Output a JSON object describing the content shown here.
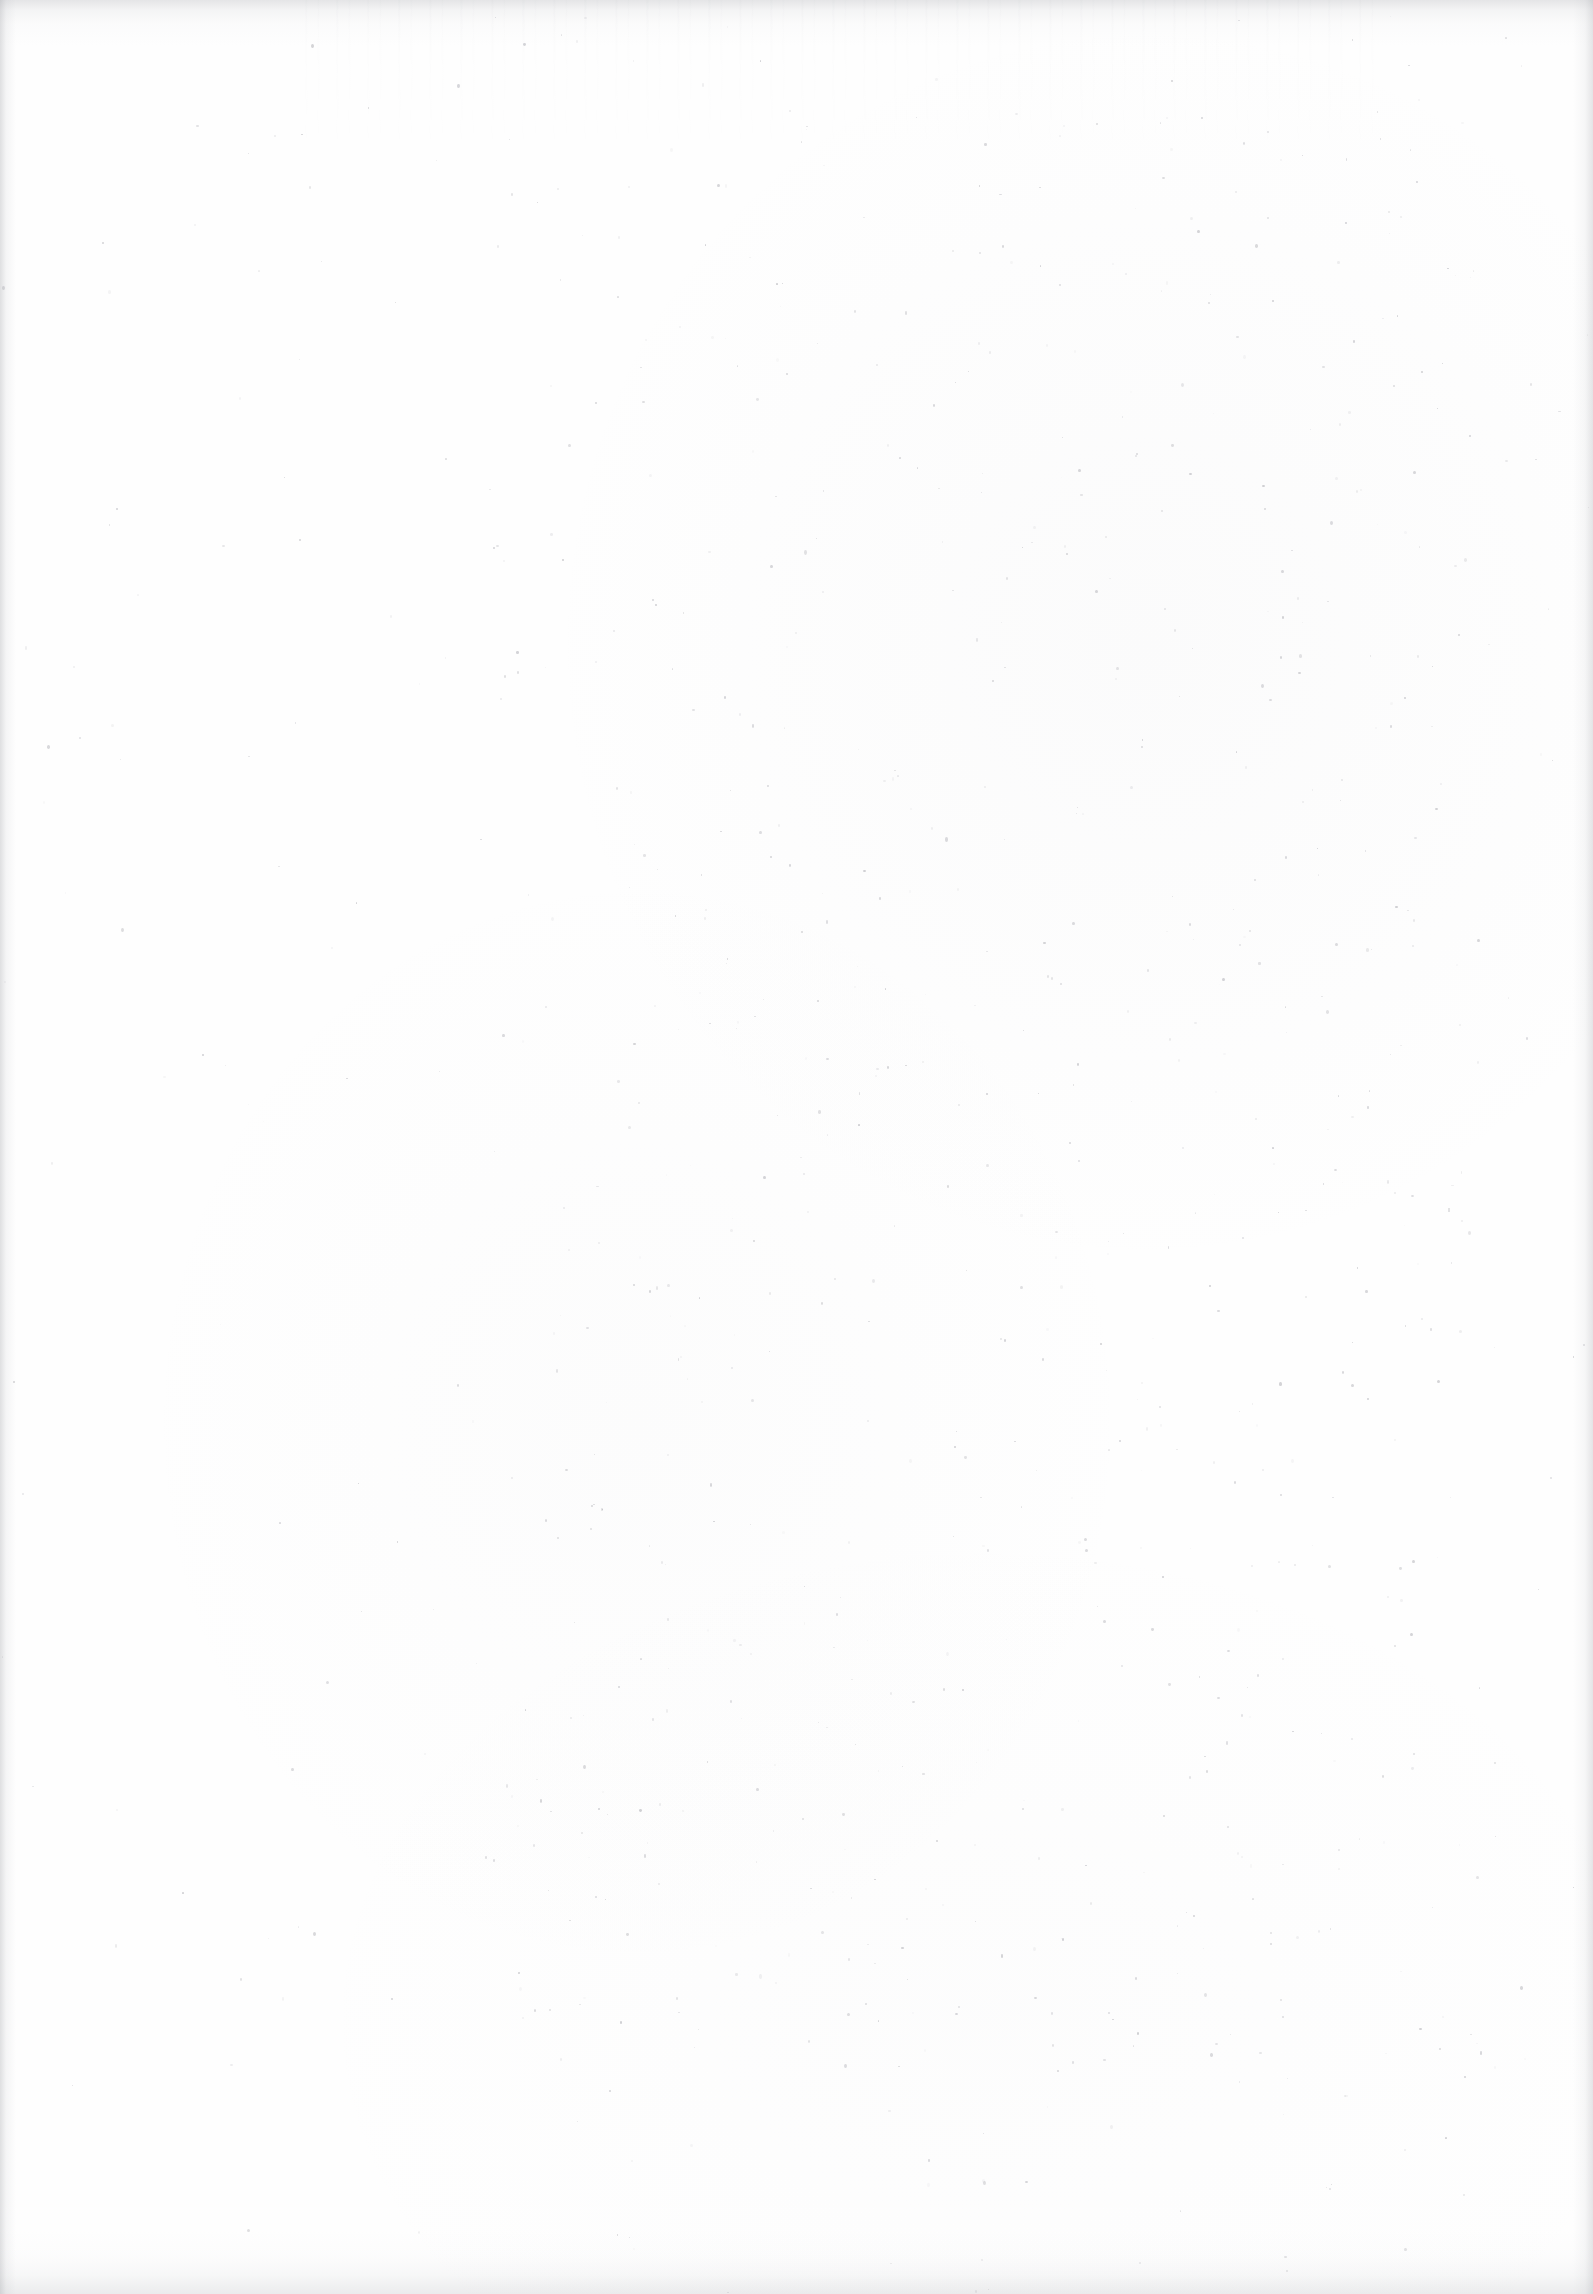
{
  "document": {
    "kind": "scanned-page",
    "page_state": "blank",
    "visible_text": "",
    "content_note": "No printed text, figures, rules, page number, headers or footers are present on this leaf."
  },
  "canvas": {
    "width": 1593,
    "height": 2294
  },
  "paper": {
    "base_color": "#fefefe",
    "tone_color": "#aaaab2",
    "speck_color": "#9a9aa2"
  },
  "edges": {
    "top": {
      "height": 46,
      "color": "#9b9da3",
      "opacity": 0.26
    },
    "bottom": {
      "height": 64,
      "color": "#a0a2a8",
      "opacity": 0.2
    },
    "left": {
      "width": 16,
      "color": "#969298",
      "opacity": 0.3
    },
    "right": {
      "width": 20,
      "color": "#989aa0",
      "opacity": 0.26
    }
  },
  "speckle": {
    "seed": 20240517,
    "count": 900,
    "min_size": 1,
    "max_size": 3,
    "min_opacity": 0.05,
    "max_opacity": 0.45,
    "density_bias_x": 0.62,
    "density_bias_y": 0.48
  }
}
